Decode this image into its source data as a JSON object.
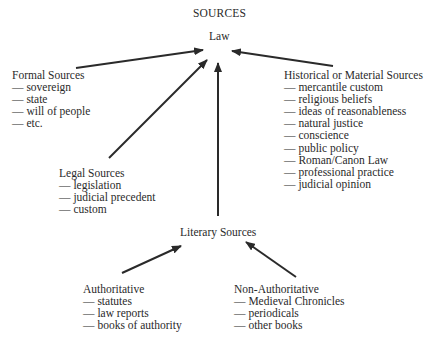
{
  "diagram": {
    "title": "SOURCES",
    "root": "Law",
    "nodes": {
      "formal": {
        "heading": "Formal Sources",
        "items": [
          "— sovereign",
          "— state",
          "— will of people",
          "— etc."
        ]
      },
      "historical": {
        "heading": "Historical or Material Sources",
        "items": [
          "— mercantile custom",
          "— religious beliefs",
          "— ideas of reasonableness",
          "— natural justice",
          "— conscience",
          "— public policy",
          "— Roman/Canon Law",
          "— professional practice",
          "— judicial opinion"
        ]
      },
      "legal": {
        "heading": "Legal Sources",
        "items": [
          "— legislation",
          "— judicial precedent",
          "— custom"
        ]
      },
      "literary": {
        "heading": "Literary Sources"
      },
      "authoritative": {
        "heading": "Authoritative",
        "items": [
          "— statutes",
          "— law reports",
          "— books of authority"
        ]
      },
      "non_authoritative": {
        "heading": "Non-Authoritative",
        "items": [
          "— Medieval Chronicles",
          "— periodicals",
          "— other books"
        ]
      }
    },
    "edges": [
      {
        "from": "Formal Sources",
        "to": "Law"
      },
      {
        "from": "Legal Sources",
        "to": "Law"
      },
      {
        "from": "Literary Sources",
        "to": "Law"
      },
      {
        "from": "Historical or Material Sources",
        "to": "Law"
      },
      {
        "from": "Authoritative",
        "to": "Literary Sources"
      },
      {
        "from": "Non-Authoritative",
        "to": "Literary Sources"
      }
    ],
    "colors": {
      "ink": "#2a2a2a",
      "background": "#ffffff"
    }
  }
}
